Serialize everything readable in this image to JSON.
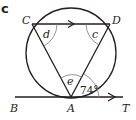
{
  "figure": {
    "part_label": "c",
    "points": {
      "C": {
        "label": "C",
        "x": 32,
        "y": 24
      },
      "D": {
        "label": "D",
        "x": 110,
        "y": 24
      },
      "A": {
        "label": "A",
        "x": 71,
        "y": 97
      },
      "B": {
        "label": "B",
        "x": 14,
        "y": 97
      },
      "T": {
        "label": "T",
        "x": 124,
        "y": 97
      }
    },
    "circle": {
      "cx": 71,
      "cy": 53,
      "r": 45
    },
    "angles": {
      "d": {
        "label": "d",
        "vertex": "C"
      },
      "c": {
        "label": "c",
        "vertex": "D"
      },
      "e": {
        "label": "e",
        "vertex": "A"
      },
      "tangent_angle": {
        "label": "74°",
        "vertex": "A",
        "value": 74
      }
    },
    "parallel_arrow": {
      "segment": "CD"
    },
    "tangent_line": {
      "from": "B",
      "to": "T",
      "arrow_towards": "T"
    },
    "colors": {
      "stroke": "#231f20",
      "background": "#ffffff"
    }
  }
}
